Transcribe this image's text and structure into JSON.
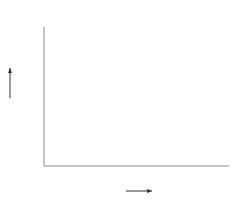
{
  "chart_data": {
    "type": "line",
    "title": "",
    "unit_label": "[℃]",
    "xlabel": "월",
    "ylabel": "기온",
    "xlim": [
      0,
      12.5
    ],
    "ylim": [
      0,
      37
    ],
    "x_ticks": [
      1,
      2,
      3,
      4,
      5,
      6,
      7,
      8,
      9,
      10,
      11,
      12
    ],
    "y_ticks": [
      5,
      10,
      15,
      20,
      25,
      30,
      35
    ],
    "origin_label": "0",
    "grid": false,
    "series": [
      {
        "name": "t_o",
        "x": [
          0.3,
          1,
          2,
          3,
          4,
          5,
          6,
          7,
          7.5,
          8,
          8.5,
          9,
          9.5,
          10,
          10.5,
          11,
          11.3,
          11.6
        ],
        "values": [
          2.5,
          4.5,
          7.5,
          11,
          14.5,
          18.5,
          22.5,
          27,
          28.5,
          29,
          28.5,
          26,
          20,
          13,
          9,
          6.8,
          6.2,
          6
        ]
      }
    ],
    "reference_lines": [
      {
        "name": "t_o*",
        "label_main": "t",
        "label_sub": "o",
        "label_sup": "*",
        "value": 25,
        "x_start": 4,
        "x_end": 11.9
      },
      {
        "name": "t_i",
        "label_main": "t",
        "label_sub": "i",
        "value": 21.5,
        "x_start": 4,
        "x_end": 11.9
      }
    ],
    "annotations": [
      {
        "text": "t",
        "sub": "o",
        "x": 9.7,
        "y": 27.5
      },
      {
        "text": "Z",
        "x_from": 6.6,
        "x_to": 9.5,
        "y": 16.5
      }
    ],
    "hatched_region": {
      "x_from": 6.6,
      "x_to": 9.5,
      "bottom_value": 21.5
    }
  }
}
